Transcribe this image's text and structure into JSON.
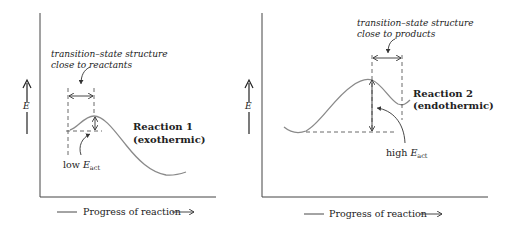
{
  "panels": [
    {
      "id": "reaction-1",
      "title": "Reaction 1",
      "subtitle": "(exothermic)",
      "annotation_line1": "transition–state structure",
      "annotation_line2": "close to reactants",
      "energy_label_prefix": "low ",
      "energy_symbol": "E",
      "energy_subscript": "act",
      "y_axis_label": "E",
      "x_axis_label": "Progress of reaction"
    },
    {
      "id": "reaction-2",
      "title": "Reaction 2",
      "subtitle": "(endothermic)",
      "annotation_line1": "transition–state structure",
      "annotation_line2": "close to products",
      "energy_label_prefix": "high ",
      "energy_symbol": "E",
      "energy_subscript": "act",
      "y_axis_label": "E",
      "x_axis_label": "Progress of reaction"
    }
  ],
  "colors": {
    "curve": "#8a8a8a",
    "axis": "#333333",
    "text": "#222222"
  }
}
